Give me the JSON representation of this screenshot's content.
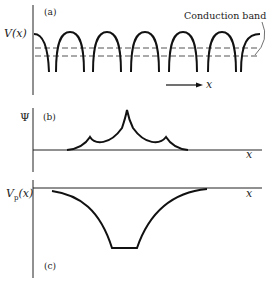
{
  "figure": {
    "panels": [
      {
        "id": "a",
        "label": "(a)",
        "ylabel": "V(x)",
        "annotation": "Conduction band",
        "arrow_label": "x",
        "description": "Periodic crystal potential with a slightly deeper impurity well; dashed lines mark conduction band edge and impurity level"
      },
      {
        "id": "b",
        "label": "(b)",
        "ylabel": "Ψ",
        "xlabel": "x",
        "description": "Localized impurity wavefunction with central cusp and two smaller side cusps"
      },
      {
        "id": "c",
        "label": "(c)",
        "ylabel_main": "V",
        "ylabel_sub": "p",
        "ylabel_arg": "(x)",
        "xlabel": "x",
        "description": "Effective impurity potential well with flat bottom"
      }
    ]
  }
}
